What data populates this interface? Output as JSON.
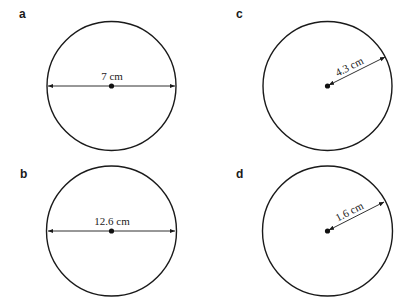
{
  "figure": {
    "panels": [
      {
        "id": "a",
        "label": "a",
        "measurement": "diameter",
        "value_text": "7 cm",
        "value": 7,
        "unit": "cm"
      },
      {
        "id": "b",
        "label": "b",
        "measurement": "diameter",
        "value_text": "12.6 cm",
        "value": 12.6,
        "unit": "cm"
      },
      {
        "id": "c",
        "label": "c",
        "measurement": "radius",
        "value_text": "4.3 cm",
        "value": 4.3,
        "unit": "cm"
      },
      {
        "id": "d",
        "label": "d",
        "measurement": "radius",
        "value_text": "1.6 cm",
        "value": 1.6,
        "unit": "cm"
      }
    ],
    "colors": {
      "stroke": "#1a1a1a",
      "background": "#ffffff"
    }
  }
}
